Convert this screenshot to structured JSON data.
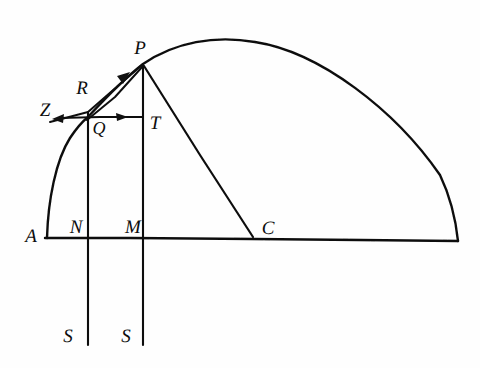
{
  "figure": {
    "ink_color": "#111111",
    "background_color": "#fefefe",
    "stroke_width": 2.0,
    "labels": [
      {
        "name": "label-P",
        "text": "P",
        "x": 140,
        "y": 48,
        "size": "lbl-lg"
      },
      {
        "name": "label-R",
        "text": "R",
        "x": 82,
        "y": 88,
        "size": "lbl-lg"
      },
      {
        "name": "label-Z",
        "text": "Z",
        "x": 45,
        "y": 110,
        "size": "lbl-lg"
      },
      {
        "name": "label-Q",
        "text": "Q",
        "x": 99,
        "y": 128,
        "size": "lbl-md"
      },
      {
        "name": "label-T",
        "text": "T",
        "x": 155,
        "y": 123,
        "size": "lbl-lg"
      },
      {
        "name": "label-A",
        "text": "A",
        "x": 31,
        "y": 236,
        "size": "lbl-lg"
      },
      {
        "name": "label-N",
        "text": "N",
        "x": 76,
        "y": 227,
        "size": "lbl-lg"
      },
      {
        "name": "label-M",
        "text": "M",
        "x": 133,
        "y": 227,
        "size": "lbl-lg"
      },
      {
        "name": "label-C",
        "text": "C",
        "x": 268,
        "y": 228,
        "size": "lbl-lg"
      },
      {
        "name": "label-S-left",
        "text": "S",
        "x": 68,
        "y": 336,
        "size": "lbl-lg"
      },
      {
        "name": "label-S-right",
        "text": "S",
        "x": 126,
        "y": 336,
        "size": "lbl-lg"
      }
    ],
    "points": {
      "A": [
        47,
        238
      ],
      "N": [
        88,
        238
      ],
      "M": [
        143,
        238
      ],
      "C": [
        253,
        238
      ],
      "B": [
        458,
        241
      ],
      "Q": [
        88,
        117
      ],
      "T": [
        143,
        117
      ],
      "P": [
        143,
        64
      ],
      "R": [
        88,
        117
      ],
      "Z": [
        56,
        119
      ],
      "S_left": [
        88,
        345
      ],
      "S_right": [
        143,
        345
      ]
    },
    "segments": [
      {
        "name": "baseline-AB",
        "from": "A",
        "to": "B"
      },
      {
        "name": "ordinate-NS-left",
        "from": "Q",
        "to": "S_left"
      },
      {
        "name": "ordinate-MS-right",
        "from": "P",
        "to": "S_right"
      },
      {
        "name": "chord-QT",
        "from": "Q",
        "to": "T"
      },
      {
        "name": "tangent-ZP",
        "from": "Z",
        "to": "P"
      },
      {
        "name": "secant-QP",
        "from": "Q",
        "to": "P"
      },
      {
        "name": "radius-PC",
        "from": "P",
        "to": "C"
      }
    ],
    "arrows": [
      {
        "name": "arrow-toward-Z",
        "at": [
          57,
          118
        ],
        "direction": "left"
      },
      {
        "name": "arrow-toward-T",
        "at": [
          122,
          117
        ],
        "direction": "right"
      },
      {
        "name": "arrow-toward-P",
        "at": [
          124,
          78
        ],
        "direction": "up-right"
      }
    ],
    "curve": {
      "name": "main-arc-APB",
      "type": "hand-drawn-arc",
      "through": [
        "A",
        "Q",
        "P",
        "apex",
        "B"
      ],
      "apex": [
        255,
        42
      ]
    }
  }
}
